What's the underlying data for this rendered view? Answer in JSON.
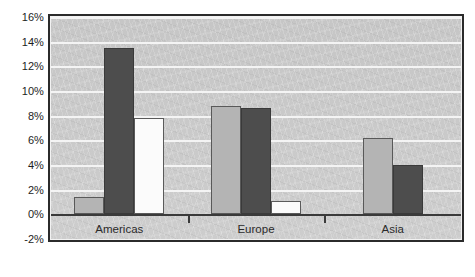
{
  "chart_data": {
    "type": "bar",
    "title": "",
    "subtitle": "",
    "xlabel": "",
    "ylabel": "",
    "categories": [
      "Americas",
      "Europe",
      "Asia"
    ],
    "series": [
      {
        "name": "series-1",
        "color": "#b4b4b4",
        "values": [
          1.4,
          8.8,
          6.2
        ]
      },
      {
        "name": "series-2",
        "color": "#4d4d4d",
        "values": [
          13.5,
          8.6,
          4.0
        ]
      },
      {
        "name": "series-3",
        "color": "#fbfbfb",
        "values": [
          7.8,
          1.1,
          null
        ]
      }
    ],
    "ylim": [
      -2,
      16
    ],
    "ytick_values": [
      16,
      14,
      12,
      10,
      8,
      6,
      4,
      2,
      0,
      -2
    ],
    "ytick_labels": [
      "16%",
      "14%",
      "12%",
      "10%",
      "8%",
      "6%",
      "4%",
      "2%",
      "0%",
      "-2%"
    ],
    "grid": true,
    "gridline_values": [
      16,
      14,
      12,
      10,
      8,
      6,
      4,
      2
    ],
    "zero_value": 0,
    "legend": false,
    "legend_position": "none",
    "annotations": []
  },
  "chart": {
    "caption": "",
    "plot_background_color": "#c8c8c8",
    "frame_color": "#2b2b2b",
    "gridline_color": "#f4f4f4",
    "axis_color": "#3a3a3a"
  }
}
